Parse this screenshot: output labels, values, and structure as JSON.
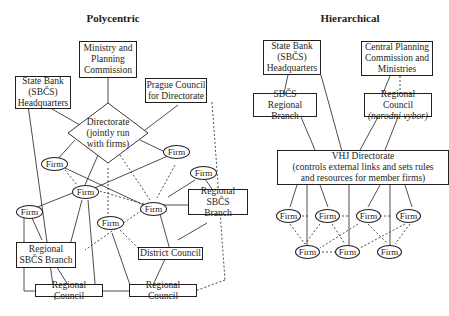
{
  "polycentric": {
    "title": "Polycentric",
    "ministry": "Ministry and\nPlanning\nCommission",
    "state_bank": "State Bank\n(SBČS)\nHeadquarters",
    "prague_council": "Prague Council\nfor Directorate",
    "directorate": "Directorate\n(jointly run\nwith firms)",
    "regional_sbcs_right": "Regional SBČS\nBranch",
    "regional_sbcs_left": "Regional\nSBČS Branch",
    "district_council": "District Council",
    "regional_council_1": "Regional Council",
    "regional_council_2": "Regional Council",
    "firm_label": "Firm"
  },
  "hierarchical": {
    "title": "Hierarchical",
    "state_bank": "State Bank\n(SBČS)\nHeadquarters",
    "central_planning": "Central Planning\nCommission and\nMinistries",
    "sbcs_regional": "SBČS\nRegional Branch",
    "regional_council": "Regional Council",
    "regional_council_sub": "(narodni vybor)",
    "vhj": "VHJ Directorate\n(controls external links and sets rules\nand resources for member firms)",
    "firm_label": "Firm"
  }
}
